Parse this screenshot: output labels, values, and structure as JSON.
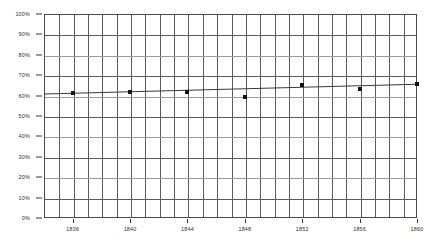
{
  "chart_data": {
    "type": "scatter",
    "title": "",
    "subtitle": "",
    "xlabel": "",
    "ylabel": "",
    "x": [
      1836,
      1840,
      1844,
      1848,
      1852,
      1856,
      1860
    ],
    "values": [
      61.5,
      62.0,
      62.0,
      59.5,
      65.0,
      63.0,
      65.5
    ],
    "series": [
      {
        "name": "Observed share",
        "x": [
          1836,
          1840,
          1844,
          1848,
          1852,
          1856,
          1860
        ],
        "values": [
          61.5,
          62.0,
          62.0,
          59.5,
          65.0,
          63.0,
          65.5
        ],
        "marker": "square",
        "color": "#111111"
      },
      {
        "name": "Trend line",
        "x": [
          1834,
          1860
        ],
        "values": [
          60.8,
          65.6
        ],
        "color": "#3a3a3a",
        "style": "solid"
      }
    ],
    "xlim": [
      1834,
      1860
    ],
    "ylim": [
      0,
      100
    ],
    "ytick_labels": [
      "100%",
      "90%",
      "80%",
      "70%",
      "60%",
      "50%",
      "40%",
      "30%",
      "20%",
      "10%",
      "0%"
    ],
    "ytick_values": [
      100,
      90,
      80,
      70,
      60,
      50,
      40,
      30,
      20,
      10,
      0
    ],
    "xtick_labels": [
      "1836",
      "1840",
      "1844",
      "1848",
      "1852",
      "1856",
      "1860"
    ],
    "xtick_values": [
      1836,
      1840,
      1844,
      1848,
      1852,
      1856,
      1860
    ],
    "grid": true,
    "grid_x_step": 1,
    "grid_y_step": 10,
    "legend": "none",
    "legend_position": "none",
    "annotations": []
  },
  "colors": {
    "grid": "#5b5b5b",
    "grid_faint": "#9a9a9a",
    "axis": "#4a4a4a",
    "marker": "#111111",
    "trend": "#3a3a3a",
    "background": "#ffffff",
    "tick_text": "#2b2b2b"
  }
}
